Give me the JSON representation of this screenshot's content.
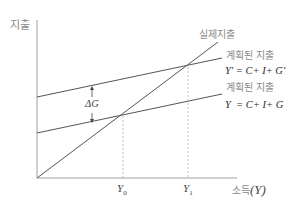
{
  "diagram": {
    "type": "keynesian-cross",
    "y_axis_label": "지출",
    "x_axis_label_kr": "소득",
    "x_axis_label_sym": "(Y)",
    "lines": {
      "actual": {
        "label": "실제지출"
      },
      "planned_new": {
        "label": "계획된 지출",
        "equation": "Y' = C+ I+ G'"
      },
      "planned_old": {
        "label": "계획된 지출",
        "equation": "Y  = C+ I+ G"
      }
    },
    "shift_label": "ΔG",
    "ticks": {
      "y0": {
        "main": "Y",
        "sub": "0"
      },
      "y1": {
        "main": "Y",
        "sub": "1"
      }
    },
    "colors": {
      "axis": "#9a9a9a",
      "line": "#4a4a4a",
      "dotted": "#bdbdbd",
      "label": "#8a8a8a"
    }
  }
}
